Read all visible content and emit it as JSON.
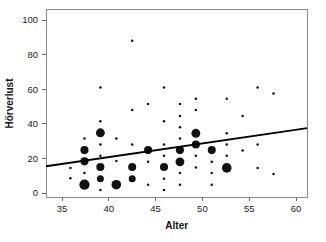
{
  "chart_data": {
    "type": "scatter",
    "title": "",
    "subtitle": "",
    "xlabel": "Alter",
    "ylabel": "Hörverlust",
    "xlim": [
      33.3,
      61.2
    ],
    "ylim": [
      -2.5,
      106
    ],
    "grid": false,
    "legend": "none",
    "xticks": [
      35,
      40,
      45,
      50,
      55,
      60
    ],
    "yticks": [
      0,
      20,
      40,
      60,
      80,
      100
    ],
    "xtick_labels": [
      "35",
      "40",
      "45",
      "50",
      "55",
      "60"
    ],
    "ytick_labels": [
      "0",
      "20",
      "40",
      "60",
      "80",
      "100"
    ],
    "marker_note": "bubble size encodes frequency of identical observations",
    "series": [
      {
        "name": "observations",
        "color": "#111111",
        "points": [
          {
            "x": 35.9,
            "y": 14.5,
            "size": 1
          },
          {
            "x": 35.9,
            "y": 8.5,
            "size": 1
          },
          {
            "x": 37.4,
            "y": 31.5,
            "size": 1
          },
          {
            "x": 37.4,
            "y": 24.8,
            "size": 3
          },
          {
            "x": 37.4,
            "y": 18.3,
            "size": 3
          },
          {
            "x": 37.4,
            "y": 11.5,
            "size": 1
          },
          {
            "x": 37.4,
            "y": 4.8,
            "size": 6
          },
          {
            "x": 39.1,
            "y": 61.0,
            "size": 1
          },
          {
            "x": 39.1,
            "y": 41.5,
            "size": 1
          },
          {
            "x": 39.1,
            "y": 34.8,
            "size": 4
          },
          {
            "x": 39.1,
            "y": 28.0,
            "size": 1
          },
          {
            "x": 39.1,
            "y": 21.5,
            "size": 1
          },
          {
            "x": 39.1,
            "y": 15.0,
            "size": 3
          },
          {
            "x": 39.1,
            "y": 8.2,
            "size": 2
          },
          {
            "x": 39.1,
            "y": 1.8,
            "size": 1
          },
          {
            "x": 40.8,
            "y": 31.5,
            "size": 1
          },
          {
            "x": 40.8,
            "y": 18.5,
            "size": 1
          },
          {
            "x": 40.8,
            "y": 4.8,
            "size": 5
          },
          {
            "x": 42.5,
            "y": 88.0,
            "size": 1
          },
          {
            "x": 42.5,
            "y": 48.0,
            "size": 1
          },
          {
            "x": 42.5,
            "y": 28.0,
            "size": 1
          },
          {
            "x": 42.5,
            "y": 15.0,
            "size": 3
          },
          {
            "x": 42.5,
            "y": 8.2,
            "size": 2
          },
          {
            "x": 44.2,
            "y": 51.5,
            "size": 1
          },
          {
            "x": 44.2,
            "y": 24.8,
            "size": 3
          },
          {
            "x": 44.2,
            "y": 18.0,
            "size": 1
          },
          {
            "x": 44.2,
            "y": 4.8,
            "size": 1
          },
          {
            "x": 45.9,
            "y": 61.0,
            "size": 1
          },
          {
            "x": 45.9,
            "y": 41.5,
            "size": 1
          },
          {
            "x": 45.9,
            "y": 28.0,
            "size": 1
          },
          {
            "x": 45.9,
            "y": 21.5,
            "size": 1
          },
          {
            "x": 45.9,
            "y": 15.0,
            "size": 3
          },
          {
            "x": 45.9,
            "y": 8.2,
            "size": 1
          },
          {
            "x": 45.9,
            "y": 1.8,
            "size": 1
          },
          {
            "x": 47.6,
            "y": 51.5,
            "size": 1
          },
          {
            "x": 47.6,
            "y": 44.5,
            "size": 1
          },
          {
            "x": 47.6,
            "y": 38.0,
            "size": 1
          },
          {
            "x": 47.6,
            "y": 31.5,
            "size": 1
          },
          {
            "x": 47.6,
            "y": 24.8,
            "size": 3
          },
          {
            "x": 47.6,
            "y": 18.0,
            "size": 4
          },
          {
            "x": 47.6,
            "y": 11.5,
            "size": 1
          },
          {
            "x": 47.6,
            "y": 4.8,
            "size": 1
          },
          {
            "x": 49.3,
            "y": 54.5,
            "size": 1
          },
          {
            "x": 49.3,
            "y": 48.0,
            "size": 1
          },
          {
            "x": 49.3,
            "y": 34.5,
            "size": 4
          },
          {
            "x": 49.3,
            "y": 28.0,
            "size": 3
          },
          {
            "x": 49.3,
            "y": 21.5,
            "size": 1
          },
          {
            "x": 49.3,
            "y": 14.8,
            "size": 1
          },
          {
            "x": 51.0,
            "y": 24.8,
            "size": 3
          },
          {
            "x": 51.0,
            "y": 18.0,
            "size": 1
          },
          {
            "x": 51.0,
            "y": 11.5,
            "size": 1
          },
          {
            "x": 51.0,
            "y": 4.8,
            "size": 1
          },
          {
            "x": 52.6,
            "y": 54.5,
            "size": 1
          },
          {
            "x": 52.6,
            "y": 34.5,
            "size": 1
          },
          {
            "x": 52.6,
            "y": 28.0,
            "size": 1
          },
          {
            "x": 52.6,
            "y": 21.5,
            "size": 1
          },
          {
            "x": 52.6,
            "y": 14.5,
            "size": 5
          },
          {
            "x": 54.3,
            "y": 44.5,
            "size": 1
          },
          {
            "x": 54.3,
            "y": 24.5,
            "size": 1
          },
          {
            "x": 55.9,
            "y": 61.0,
            "size": 1
          },
          {
            "x": 55.9,
            "y": 28.0,
            "size": 1
          },
          {
            "x": 55.9,
            "y": 14.5,
            "size": 1
          },
          {
            "x": 57.6,
            "y": 57.5,
            "size": 1
          },
          {
            "x": 57.6,
            "y": 11.0,
            "size": 1
          }
        ]
      }
    ],
    "trendline": {
      "name": "linear fit",
      "color": "#000000",
      "x0": 33.3,
      "y0": 15.5,
      "x1": 61.2,
      "y1": 37.5
    }
  }
}
